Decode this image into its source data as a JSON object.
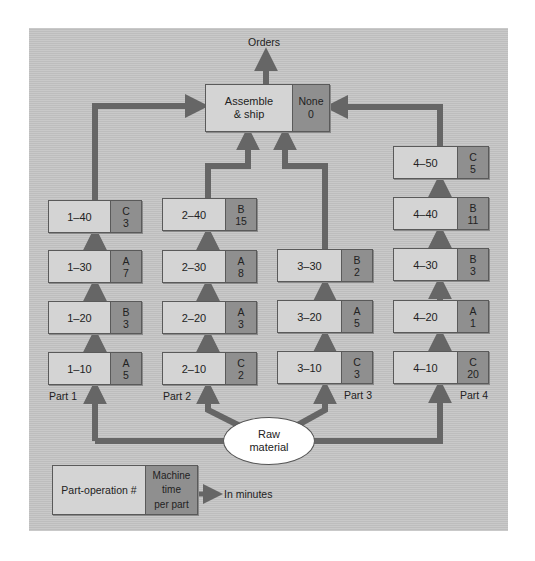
{
  "diagram": {
    "type": "process-flow",
    "output_label": "Orders",
    "assemble": {
      "operation": [
        "Assemble",
        "& ship"
      ],
      "machine": "None",
      "time": "0"
    },
    "raw_material": [
      "Raw",
      "material"
    ],
    "parts": [
      {
        "label": "Part 1",
        "operations": [
          {
            "op": "1–10",
            "machine": "A",
            "time": "5"
          },
          {
            "op": "1–20",
            "machine": "B",
            "time": "3"
          },
          {
            "op": "1–30",
            "machine": "A",
            "time": "7"
          },
          {
            "op": "1–40",
            "machine": "C",
            "time": "3"
          }
        ]
      },
      {
        "label": "Part 2",
        "operations": [
          {
            "op": "2–10",
            "machine": "C",
            "time": "2"
          },
          {
            "op": "2–20",
            "machine": "A",
            "time": "3"
          },
          {
            "op": "2–30",
            "machine": "A",
            "time": "8"
          },
          {
            "op": "2–40",
            "machine": "B",
            "time": "15"
          }
        ]
      },
      {
        "label": "Part 3",
        "operations": [
          {
            "op": "3–10",
            "machine": "C",
            "time": "3"
          },
          {
            "op": "3–20",
            "machine": "A",
            "time": "5"
          },
          {
            "op": "3–30",
            "machine": "B",
            "time": "2"
          }
        ]
      },
      {
        "label": "Part 4",
        "operations": [
          {
            "op": "4–10",
            "machine": "C",
            "time": "20"
          },
          {
            "op": "4–20",
            "machine": "A",
            "time": "1"
          },
          {
            "op": "4–30",
            "machine": "B",
            "time": "3"
          },
          {
            "op": "4–40",
            "machine": "B",
            "time": "11"
          },
          {
            "op": "4–50",
            "machine": "C",
            "time": "5"
          }
        ]
      }
    ],
    "legend": {
      "operation_label": "Part-operation #",
      "machine_label": "Machine",
      "time_lines": [
        "time",
        "per part"
      ],
      "units_label": "In minutes"
    },
    "colors": {
      "background": "#c4c4c4",
      "operation_cell": "#d4d4d4",
      "machine_cell": "#8f8f8f",
      "arrow": "#666666",
      "ellipse": "#ffffff"
    }
  }
}
